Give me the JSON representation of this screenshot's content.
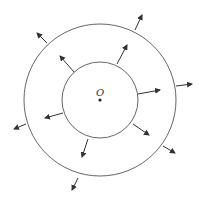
{
  "diagram": {
    "center_label": "O",
    "center": [
      100,
      100
    ],
    "inner_circle_radius": 38,
    "outer_circle_radius": 78,
    "stroke_color": "#444444",
    "inner_arrows": [
      {
        "from": [
          117,
          64
        ],
        "to": [
          127,
          45
        ]
      },
      {
        "from": [
          74,
          72
        ],
        "to": [
          60,
          56
        ]
      },
      {
        "from": [
          138,
          94
        ],
        "to": [
          160,
          90
        ]
      },
      {
        "from": [
          133,
          124
        ],
        "to": [
          149,
          135
        ]
      },
      {
        "from": [
          63,
          113
        ],
        "to": [
          45,
          118
        ]
      },
      {
        "from": [
          88,
          139
        ],
        "to": [
          82,
          157
        ]
      }
    ],
    "outer_arrows": [
      {
        "from": [
          135,
          30
        ],
        "to": [
          142,
          15
        ]
      },
      {
        "from": [
          47,
          43
        ],
        "to": [
          37,
          33
        ]
      },
      {
        "from": [
          176,
          86
        ],
        "to": [
          192,
          84
        ]
      },
      {
        "from": [
          163,
          146
        ],
        "to": [
          175,
          153
        ]
      },
      {
        "from": [
          26,
          124
        ],
        "to": [
          14,
          129
        ]
      },
      {
        "from": [
          78,
          178
        ],
        "to": [
          72,
          190
        ]
      }
    ]
  }
}
